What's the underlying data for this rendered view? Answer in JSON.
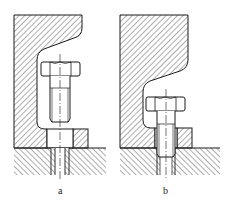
{
  "figure": {
    "panels": [
      {
        "id": "a",
        "label": "a"
      },
      {
        "id": "b",
        "label": "b"
      }
    ],
    "colors": {
      "line": "#1a1a1a",
      "hatch": "#333333",
      "background": "#ffffff"
    }
  }
}
